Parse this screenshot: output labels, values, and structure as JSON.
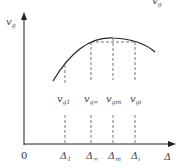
{
  "diagram": {
    "type": "function-curve",
    "y_axis": {
      "label_main": "v",
      "label_sub": "g"
    },
    "x_axis": {
      "label": "Δ"
    },
    "origin_label": "0",
    "top_cropped_label": {
      "main": "v",
      "sub": "g"
    },
    "curve": {
      "shape": "concave-down parabola with a maximum",
      "color": "#222222"
    },
    "markers": [
      {
        "v_main": "v",
        "v_sub": "g1",
        "d_main": "Δ",
        "d_sub": "1"
      },
      {
        "v_main": "v",
        "v_sub": "g∞",
        "d_main": "Δ",
        "d_sub": "∞"
      },
      {
        "v_main": "v",
        "v_sub": "gm",
        "d_main": "Δ",
        "d_sub": "m"
      },
      {
        "v_main": "v",
        "v_sub": "gi",
        "d_main": "Δ",
        "d_sub": "i"
      }
    ],
    "colors": {
      "axis": "#222222",
      "dashed": "#555555",
      "text": "#4a4a4a"
    }
  }
}
